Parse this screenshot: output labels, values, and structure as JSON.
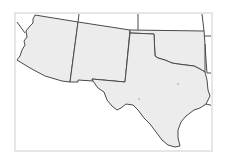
{
  "map": {
    "region": "Southwestern United States",
    "highlighted_states": [
      "Arizona",
      "New Mexico",
      "Texas",
      "Oklahoma"
    ],
    "colors": {
      "state_fill": "#ececec",
      "state_border": "#4a4a4a",
      "frame_border": "#e6e6e6",
      "background": "#ffffff",
      "city_marker": "#b8b8b8"
    },
    "markers": [
      {
        "name": "city-marker-1"
      },
      {
        "name": "city-marker-2"
      }
    ]
  }
}
